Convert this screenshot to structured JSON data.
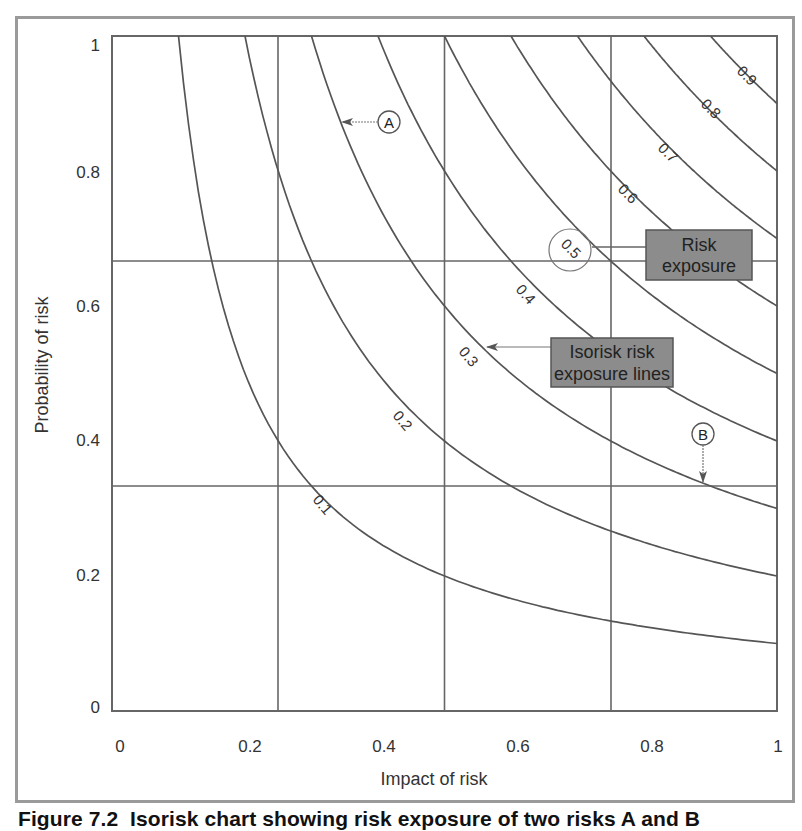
{
  "chart_data": {
    "type": "line",
    "title": "Isorisk chart showing risk exposure of two risks A and B",
    "xlabel": "Impact of risk",
    "ylabel": "Probability of risk",
    "xlim": [
      0,
      1
    ],
    "ylim": [
      0,
      1
    ],
    "x_ticks": [
      "0",
      "0.2",
      "0.4",
      "0.6",
      "0.8",
      "1"
    ],
    "y_ticks": [
      "0",
      "0.2",
      "0.4",
      "0.6",
      "0.8",
      "1"
    ],
    "grid": {
      "vertical_at": [
        0.25,
        0.5,
        0.75
      ],
      "horizontal_at": [
        0.333,
        0.667
      ]
    },
    "series": [
      {
        "name": "0.1",
        "equation": "impact * probability = 0.1"
      },
      {
        "name": "0.2",
        "equation": "impact * probability = 0.2"
      },
      {
        "name": "0.3",
        "equation": "impact * probability = 0.3"
      },
      {
        "name": "0.4",
        "equation": "impact * probability = 0.4"
      },
      {
        "name": "0.5",
        "equation": "impact * probability = 0.5",
        "highlighted": true
      },
      {
        "name": "0.6",
        "equation": "impact * probability = 0.6"
      },
      {
        "name": "0.7",
        "equation": "impact * probability = 0.7"
      },
      {
        "name": "0.8",
        "equation": "impact * probability = 0.8"
      },
      {
        "name": "0.9",
        "equation": "impact * probability = 0.9"
      }
    ],
    "points": [
      {
        "label": "A",
        "approx_x": 0.33,
        "approx_y": 0.88,
        "arrow": "left"
      },
      {
        "label": "B",
        "approx_x": 0.9,
        "approx_y": 0.4,
        "arrow": "down"
      }
    ],
    "annotations": [
      {
        "text": "Risk exposure",
        "points_to": "0.5 curve label"
      },
      {
        "text": "Isorisk risk exposure lines",
        "points_to": "0.3 curve"
      }
    ]
  },
  "axes": {
    "xlabel": "Impact of risk",
    "ylabel": "Probability of risk",
    "x_ticks": [
      "0",
      "0.2",
      "0.4",
      "0.6",
      "0.8",
      "1"
    ],
    "y_ticks": [
      "0",
      "0.2",
      "0.4",
      "0.6",
      "0.8",
      "1"
    ]
  },
  "curve_labels": [
    "0.1",
    "0.2",
    "0.3",
    "0.4",
    "0.5",
    "0.6",
    "0.7",
    "0.8",
    "0.9"
  ],
  "callouts": {
    "risk_exposure": [
      "Risk",
      "exposure"
    ],
    "isorisk": [
      "Isorisk risk",
      "exposure lines"
    ]
  },
  "points": {
    "a": "A",
    "b": "B"
  },
  "colors": {
    "line": "#555555",
    "box_fill": "#8c8c8c",
    "frame": "#9a9a9a"
  },
  "caption": {
    "number": "Figure 7.2",
    "text": "Isorisk chart showing risk exposure of two risks A and B"
  }
}
